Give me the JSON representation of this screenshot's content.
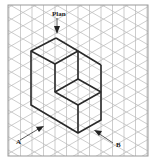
{
  "figure": {
    "type": "isometric-drawing",
    "labels": {
      "plan": "Plan",
      "a": "A",
      "b": "B"
    },
    "colors": {
      "grid": "#b8b8b8",
      "frame": "#999999",
      "shape": "#2a2a2a",
      "background": "#ffffff"
    },
    "grid": {
      "spacing_x": 11.5,
      "description": "isometric triangular grid"
    },
    "view_arrows": [
      {
        "name": "Plan",
        "direction": "down"
      },
      {
        "name": "A",
        "direction": "up-right"
      },
      {
        "name": "B",
        "direction": "up-left"
      }
    ]
  }
}
